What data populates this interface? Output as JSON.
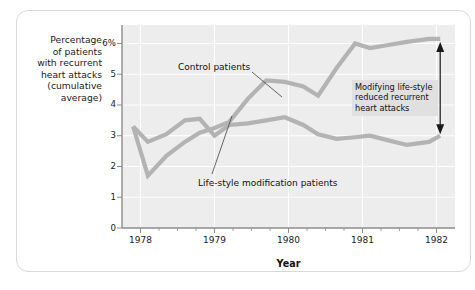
{
  "figure": {
    "y_axis_title_lines": [
      "Percentage",
      "of patients",
      "with recurrent",
      "heart attacks",
      "(cumulative",
      "average)"
    ],
    "x_axis_title": "Year",
    "annotation_lines": [
      "Modifying life-style",
      "reduced recurrent",
      "heart attacks"
    ],
    "series_labels": {
      "control": "Control patients",
      "lifestyle": "Life-style modification patients"
    },
    "colors": {
      "plot_background": "#ededed",
      "gridline": "#ffffff",
      "series_line": "#b3b3b3",
      "axis": "#8c8c8c",
      "annotation_background": "#e0e0e0",
      "frame_border": "#d9d9d9",
      "text": "#1a1a1a"
    }
  },
  "chart_data": {
    "type": "line",
    "title": "",
    "xlabel": "Year",
    "ylabel": "Percentage of patients with recurrent heart attacks (cumulative average)",
    "xlim": [
      1977.75,
      1982.25
    ],
    "ylim": [
      0,
      6.6
    ],
    "grid": true,
    "legend": "annotated-inline",
    "ytick_labels": [
      "0",
      "1",
      "2",
      "3",
      "4",
      "5",
      "6%"
    ],
    "ytick_values": [
      0,
      1,
      2,
      3,
      4,
      5,
      6
    ],
    "xtick_labels": [
      "1978",
      "1979",
      "1980",
      "1981",
      "1982"
    ],
    "xtick_values": [
      1978,
      1979,
      1980,
      1981,
      1982
    ],
    "x": [
      1977.9,
      1978.1,
      1978.35,
      1978.6,
      1978.8,
      1979.0,
      1979.2,
      1979.45,
      1979.7,
      1979.95,
      1980.2,
      1980.4,
      1980.65,
      1980.9,
      1981.1,
      1981.35,
      1981.6,
      1981.9,
      1982.05
    ],
    "series": [
      {
        "name": "Control patients",
        "values": [
          3.3,
          1.7,
          2.35,
          2.8,
          3.1,
          3.25,
          3.45,
          4.2,
          4.8,
          4.75,
          4.6,
          4.3,
          5.2,
          6.0,
          5.85,
          5.95,
          6.05,
          6.15,
          6.15
        ]
      },
      {
        "name": "Life-style modification patients",
        "values": [
          3.3,
          2.8,
          3.05,
          3.5,
          3.55,
          3.0,
          3.35,
          3.4,
          3.5,
          3.6,
          3.35,
          3.05,
          2.9,
          2.95,
          3.0,
          2.85,
          2.7,
          2.8,
          3.0
        ]
      }
    ],
    "annotations": [
      {
        "text": "Modifying life-style reduced recurrent heart attacks",
        "type": "text-box-with-double-arrow",
        "arrow_x": 1982.05,
        "arrow_y_top": 6.05,
        "arrow_y_bottom": 3.05
      }
    ]
  }
}
